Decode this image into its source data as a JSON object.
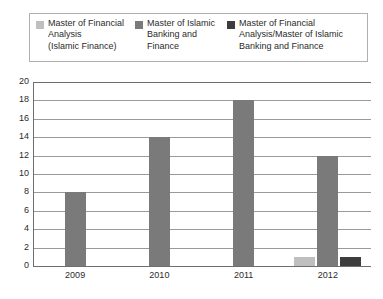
{
  "chart_data": {
    "type": "bar",
    "title": "",
    "subtitle": "",
    "xlabel": "",
    "ylabel": "",
    "categories": [
      "2009",
      "2010",
      "2011",
      "2012"
    ],
    "series": [
      {
        "name": "Master of Financial Analysis (Islamic Finance)",
        "legend_label": "Master of Financial\nAnalysis\n(Islamic Finance)",
        "color": "#bfbfbf",
        "values": [
          0,
          0,
          0,
          1
        ]
      },
      {
        "name": "Master of Islamic Banking and Finance",
        "legend_label": "Master of Islamic\nBanking and\nFinance",
        "color": "#7a7a7a",
        "values": [
          8,
          14,
          18,
          12
        ]
      },
      {
        "name": "Master of Financial Analysis/Master of Islamic Banking and Finance",
        "legend_label": "Master of Financial\nAnalysis/Master of Islamic\nBanking and Finance",
        "color": "#3d3d3d",
        "values": [
          0,
          0,
          0,
          1
        ]
      }
    ],
    "ylim": [
      0,
      20
    ],
    "ytick_step": 2,
    "yticks": [
      "20",
      "18",
      "16",
      "14",
      "12",
      "10",
      "8",
      "6",
      "4",
      "2",
      "0"
    ],
    "grid": true,
    "grid_axis": "y",
    "legend_position": "top",
    "legend_columns": 3,
    "background_color": "#ffffff",
    "grid_color": "#9a9a9a",
    "axis_color": "#6e6e6e",
    "legend_border_color": "#b0b0b0"
  }
}
